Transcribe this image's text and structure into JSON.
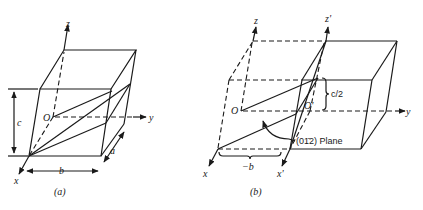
{
  "figure_a": {
    "caption": "(a)",
    "labels": {
      "z": "z",
      "y": "y",
      "x": "x",
      "origin": "O",
      "c": "c",
      "b": "b",
      "a": "a"
    }
  },
  "figure_b": {
    "caption": "(b)",
    "labels": {
      "z": "z",
      "z_prime": "z'",
      "y": "y",
      "x": "x",
      "x_prime": "x'",
      "origin": "O",
      "origin_prime": "O'",
      "half_c": "c/2",
      "minus_b": "−b",
      "plane": "(01̄2) Plane"
    }
  }
}
